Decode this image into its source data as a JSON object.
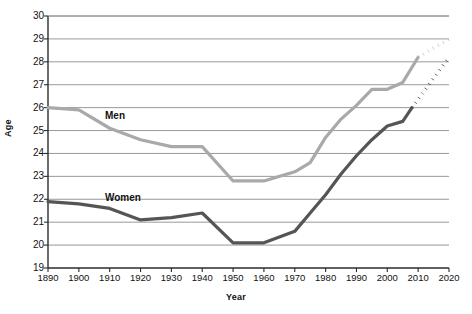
{
  "chart_data": {
    "type": "line",
    "title": "",
    "xlabel": "Year",
    "ylabel": "Age",
    "x": [
      1890,
      1900,
      1910,
      1920,
      1930,
      1940,
      1950,
      1960,
      1970,
      1980,
      1990,
      2000,
      2010,
      2020
    ],
    "xticklabels": [
      "1890",
      "1900",
      "1910",
      "1920",
      "1930",
      "1940",
      "1950",
      "1960",
      "1970",
      "1980",
      "1990",
      "2000",
      "2010",
      "2020"
    ],
    "yticklabels": [
      "19",
      "20",
      "21",
      "22",
      "23",
      "24",
      "25",
      "26",
      "27",
      "28",
      "29",
      "30"
    ],
    "xlim": [
      1890,
      2020
    ],
    "ylim": [
      19,
      30
    ],
    "grid": true,
    "grid_axis": "y",
    "legend_position": "inline-annotations",
    "series": [
      {
        "name": "Men",
        "label": "Men",
        "color": "#a9a9a9",
        "projection_color": "#bdbdbd",
        "solid_x": [
          1890,
          1900,
          1910,
          1920,
          1930,
          1940,
          1950,
          1960,
          1970,
          1975,
          1980,
          1985,
          1990,
          1995,
          2000,
          2005,
          2010
        ],
        "solid_values": [
          26.0,
          25.9,
          25.1,
          24.6,
          24.3,
          24.3,
          22.8,
          22.8,
          23.2,
          23.6,
          24.7,
          25.5,
          26.1,
          26.8,
          26.8,
          27.1,
          28.2
        ],
        "projected_x": [
          2010,
          2020
        ],
        "projected_values": [
          28.2,
          29.0
        ],
        "style": "solid-then-dotted"
      },
      {
        "name": "Women",
        "label": "Women",
        "color": "#555555",
        "projection_color": "#3a3a3a",
        "solid_x": [
          1890,
          1900,
          1910,
          1920,
          1930,
          1940,
          1950,
          1960,
          1970,
          1975,
          1980,
          1985,
          1990,
          1995,
          2000,
          2005,
          2008
        ],
        "solid_values": [
          21.9,
          21.8,
          21.6,
          21.1,
          21.2,
          21.4,
          20.1,
          20.1,
          20.6,
          21.4,
          22.2,
          23.1,
          23.9,
          24.6,
          25.2,
          25.4,
          26.0
        ],
        "projected_x": [
          2008,
          2020
        ],
        "projected_values": [
          26.0,
          28.2
        ],
        "style": "solid-then-dotted"
      }
    ],
    "annotations": [
      {
        "text": "Men",
        "x": 1920,
        "y": 25.9
      },
      {
        "text": "Women",
        "x": 1920,
        "y": 22.2
      }
    ]
  },
  "plot_area": {
    "left": 48,
    "right": 449,
    "top": 16,
    "bottom": 268,
    "frame_color": "#2b2b2b",
    "gridline_color": "#8d8d8d",
    "background": "#ffffff"
  }
}
